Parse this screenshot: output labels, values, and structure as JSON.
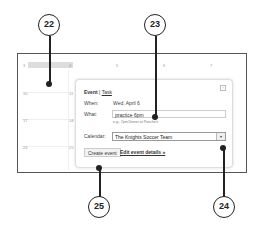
{
  "callouts": [
    {
      "label": "22"
    },
    {
      "label": "23"
    },
    {
      "label": "24"
    },
    {
      "label": "25"
    }
  ],
  "calendar": {
    "day_numbers": [
      "3",
      "4",
      "5",
      "6",
      "7",
      "10",
      "11",
      "17",
      "18",
      "24",
      "25"
    ]
  },
  "popup": {
    "tab_event": "Event",
    "tab_separator": "|",
    "tab_task": "Task",
    "when_label": "When:",
    "when_value": "Wed, April 6",
    "what_label": "What:",
    "what_value": "practice 6pm",
    "what_hint": "e.g., 7pm Dinner at Pancho's",
    "calendar_label": "Calendar:",
    "calendar_value": "The Knights Soccer Team",
    "dropdown_glyph": "▾",
    "close_glyph": "×",
    "create_button": "Create event",
    "edit_link": "Edit event details »"
  }
}
